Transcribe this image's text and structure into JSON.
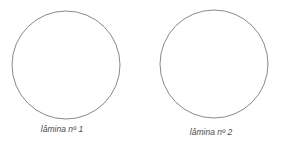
{
  "diagram": {
    "stroke_color": "#6a6a6a",
    "slides": [
      {
        "label": "lâmina nº 1",
        "cx": 66,
        "cy": 65,
        "r": 54,
        "label_x": 62,
        "label_y": 124
      },
      {
        "label": "lâmina nº 2",
        "cx": 214,
        "cy": 64,
        "r": 54,
        "label_x": 211,
        "label_y": 127
      }
    ]
  }
}
